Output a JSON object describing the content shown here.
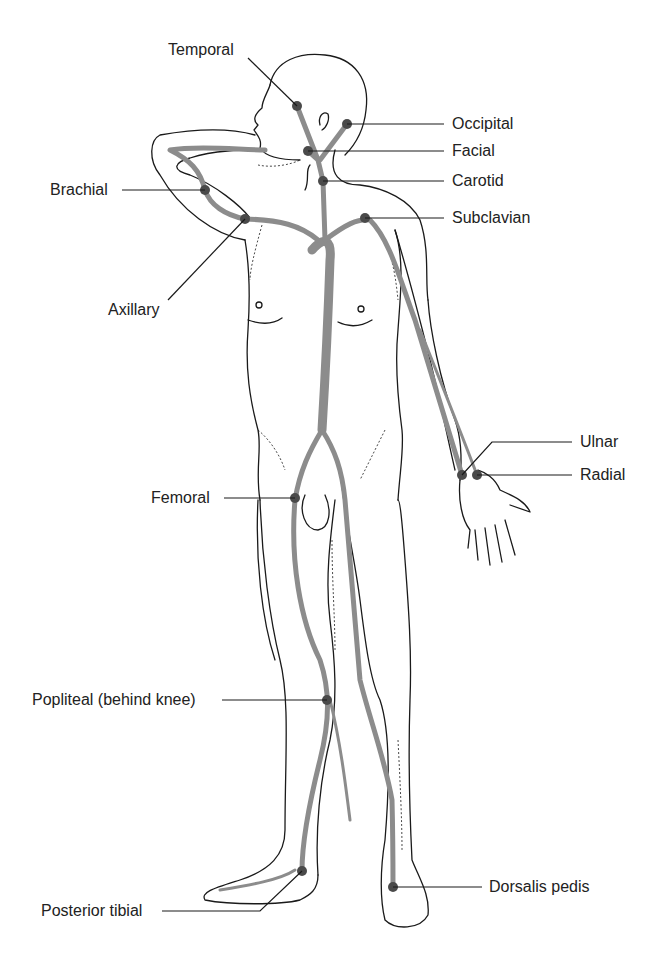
{
  "figure": {
    "type": "anatomical diagram",
    "colors": {
      "outline": "#1a1a1a",
      "artery": "#8c8c8c",
      "pulse_point": "#4a4a4a",
      "leader_line": "#1a1a1a",
      "label_text": "#222222"
    }
  },
  "labels": {
    "temporal": "Temporal",
    "occipital": "Occipital",
    "facial": "Facial",
    "carotid": "Carotid",
    "subclavian": "Subclavian",
    "brachial": "Brachial",
    "axillary": "Axillary",
    "ulnar": "Ulnar",
    "radial": "Radial",
    "femoral": "Femoral",
    "popliteal": "Popliteal (behind knee)",
    "posterior_tibial": "Posterior tibial",
    "dorsalis_pedis": "Dorsalis pedis"
  },
  "pulse_points": [
    {
      "name": "Temporal",
      "x": 297,
      "y": 106
    },
    {
      "name": "Occipital",
      "x": 347,
      "y": 124
    },
    {
      "name": "Facial",
      "x": 308,
      "y": 151
    },
    {
      "name": "Carotid",
      "x": 323,
      "y": 181
    },
    {
      "name": "Subclavian",
      "x": 365,
      "y": 218
    },
    {
      "name": "Brachial",
      "x": 205,
      "y": 190
    },
    {
      "name": "Axillary",
      "x": 245,
      "y": 219
    },
    {
      "name": "Ulnar",
      "x": 462,
      "y": 475
    },
    {
      "name": "Radial",
      "x": 477,
      "y": 475
    },
    {
      "name": "Femoral",
      "x": 295,
      "y": 498
    },
    {
      "name": "Popliteal (behind knee)",
      "x": 327,
      "y": 700
    },
    {
      "name": "Posterior tibial",
      "x": 302,
      "y": 871
    },
    {
      "name": "Dorsalis pedis",
      "x": 393,
      "y": 887
    }
  ]
}
